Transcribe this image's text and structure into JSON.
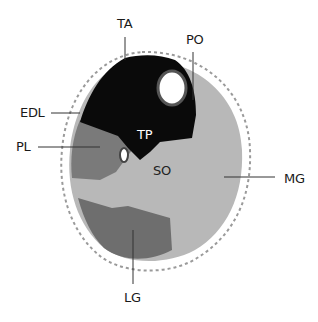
{
  "figure": {
    "type": "cross-section diagram of lower leg muscles",
    "colors": {
      "background": "#ffffff",
      "deep_anterior": "#0a0a0a",
      "soleus_gastrocnemius_medial": "#b8b8b8",
      "peroneus_longus": "#7a7a7a",
      "lateral_gastrocnemius": "#6e6e6e",
      "bone": "#ffffff",
      "skin_outline": "#9a9a9a",
      "leader_line": "#333333"
    }
  },
  "labels": {
    "ta": "TA",
    "po": "PO",
    "edl": "EDL",
    "pl": "PL",
    "tp": "TP",
    "so": "SO",
    "mg": "MG",
    "lg": "LG"
  }
}
